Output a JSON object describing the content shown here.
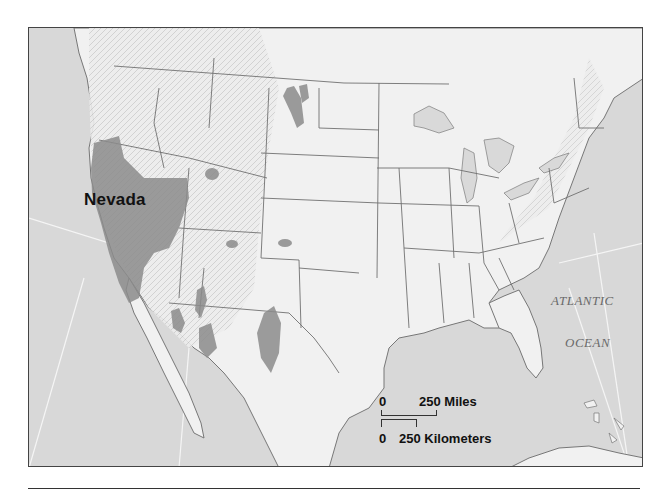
{
  "map": {
    "title": "",
    "highlighted_region_label": "Nevada",
    "water_labels": [
      "ATLANTIC",
      "OCEAN"
    ],
    "scale": {
      "miles": {
        "start": "0",
        "end": "250 Miles"
      },
      "kilometers": {
        "start": "0",
        "end": "250 Kilometers"
      }
    },
    "colors": {
      "water": "#d6d6d6",
      "land": "#f3f3f3",
      "relief": "#c8c8c8",
      "highlight": "#8a8a8a",
      "border": "#6e6e6e",
      "frame": "#444444"
    },
    "shaded_regions": [
      "Great Basin (Nevada / western Utah / SE California)",
      "North Dakota basin",
      "Wyoming basin",
      "Colorado basins",
      "Arizona basin",
      "New Mexico basins",
      "West Texas basin"
    ]
  }
}
